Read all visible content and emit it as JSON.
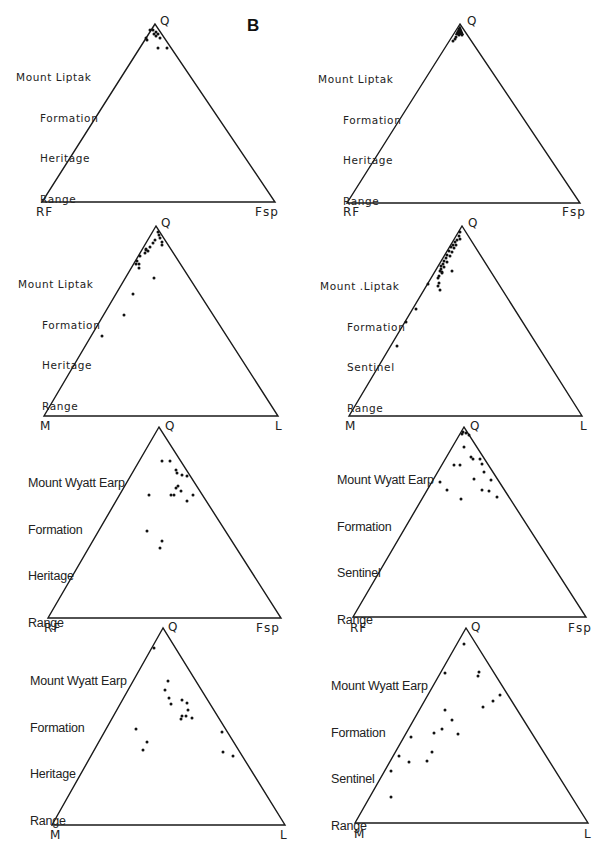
{
  "figure": {
    "panel_letter": "B",
    "top_edge_letter": "A"
  },
  "chart_data": [
    {
      "type": "scatter",
      "subtype": "ternary",
      "id": "p1",
      "caption": [
        "Mount Liptak",
        "Formation",
        "Heritage",
        "Range"
      ],
      "vertices": {
        "top": "Q",
        "left": "RF",
        "right": "Fsp"
      },
      "geom": {
        "apex": [
          155,
          24
        ],
        "left": [
          42,
          202
        ],
        "right": [
          275,
          202
        ]
      },
      "points_px": [
        [
          150,
          30
        ],
        [
          153,
          30
        ],
        [
          156,
          32
        ],
        [
          158,
          34
        ],
        [
          156,
          36
        ],
        [
          146,
          38
        ],
        [
          160,
          38
        ],
        [
          147,
          40
        ],
        [
          158,
          48
        ],
        [
          167,
          48
        ],
        [
          154,
          34
        ]
      ]
    },
    {
      "type": "scatter",
      "subtype": "ternary",
      "id": "p2",
      "caption": [
        "Mount Liptak",
        "Formation",
        "Heritage",
        "Range"
      ],
      "vertices": {
        "top": "Q",
        "left": "RF",
        "right": "Fsp"
      },
      "geom": {
        "apex": [
          460,
          24
        ],
        "left": [
          347,
          203
        ],
        "right": [
          580,
          203
        ]
      },
      "cluster_note": "dense filled cluster at Q apex",
      "points_px": [
        [
          459,
          29
        ],
        [
          460,
          31
        ],
        [
          458,
          32
        ],
        [
          461,
          33
        ],
        [
          457,
          34
        ],
        [
          459,
          35
        ],
        [
          462,
          35
        ],
        [
          456,
          37
        ],
        [
          455,
          39
        ],
        [
          453,
          41
        ]
      ]
    },
    {
      "type": "scatter",
      "subtype": "ternary",
      "id": "p3",
      "caption": [
        "Mount Liptak",
        "Formation",
        "Heritage",
        "Range"
      ],
      "vertices": {
        "top": "Q",
        "left": "M",
        "right": "L"
      },
      "geom": {
        "apex": [
          156,
          226
        ],
        "left": [
          44,
          416
        ],
        "right": [
          278,
          416
        ]
      },
      "points_px": [
        [
          158,
          232
        ],
        [
          159,
          235
        ],
        [
          160,
          238
        ],
        [
          155,
          240
        ],
        [
          162,
          242
        ],
        [
          153,
          243
        ],
        [
          162,
          245
        ],
        [
          150,
          247
        ],
        [
          146,
          249
        ],
        [
          148,
          251
        ],
        [
          145,
          253
        ],
        [
          146,
          250
        ],
        [
          140,
          256
        ],
        [
          137,
          261
        ],
        [
          136,
          264
        ],
        [
          139,
          264
        ],
        [
          139,
          268
        ],
        [
          154,
          278
        ],
        [
          133,
          294
        ],
        [
          124,
          315
        ],
        [
          102,
          336
        ]
      ]
    },
    {
      "type": "scatter",
      "subtype": "ternary",
      "id": "p4",
      "caption": [
        "Mount .Liptak",
        "Formation",
        "Sentinel",
        "Range"
      ],
      "vertices": {
        "top": "Q",
        "left": "M",
        "right": "L"
      },
      "geom": {
        "apex": [
          462,
          226
        ],
        "left": [
          349,
          416
        ],
        "right": [
          582,
          416
        ]
      },
      "points_px": [
        [
          460,
          232
        ],
        [
          459,
          236
        ],
        [
          457,
          240
        ],
        [
          460,
          239
        ],
        [
          455,
          242
        ],
        [
          453,
          245
        ],
        [
          456,
          245
        ],
        [
          451,
          247
        ],
        [
          454,
          248
        ],
        [
          449,
          251
        ],
        [
          452,
          252
        ],
        [
          447,
          255
        ],
        [
          450,
          256
        ],
        [
          446,
          258
        ],
        [
          444,
          261
        ],
        [
          447,
          262
        ],
        [
          443,
          264
        ],
        [
          441,
          266
        ],
        [
          444,
          267
        ],
        [
          441,
          269
        ],
        [
          440,
          271
        ],
        [
          442,
          273
        ],
        [
          439,
          276
        ],
        [
          442,
          272
        ],
        [
          438,
          278
        ],
        [
          452,
          271
        ],
        [
          439,
          283
        ],
        [
          438,
          286
        ],
        [
          440,
          290
        ],
        [
          428,
          284
        ],
        [
          416,
          309
        ],
        [
          406,
          322
        ],
        [
          397,
          346
        ]
      ]
    },
    {
      "type": "scatter",
      "subtype": "ternary",
      "id": "p5",
      "caption": [
        "Mount Wyatt Earp",
        "Formation",
        "Heritage",
        "Range"
      ],
      "vertices": {
        "top": "Q",
        "left": "RF",
        "right": "Fsp"
      },
      "geom": {
        "apex": [
          159,
          427
        ],
        "left": [
          48,
          618
        ],
        "right": [
          281,
          618
        ]
      },
      "points_px": [
        [
          162,
          461
        ],
        [
          170,
          461
        ],
        [
          176,
          470
        ],
        [
          177,
          473
        ],
        [
          182,
          475
        ],
        [
          187,
          476
        ],
        [
          178,
          486
        ],
        [
          176,
          488
        ],
        [
          181,
          491
        ],
        [
          171,
          495
        ],
        [
          174,
          495
        ],
        [
          193,
          495
        ],
        [
          149,
          495
        ],
        [
          187,
          501
        ],
        [
          147,
          531
        ],
        [
          162,
          541
        ],
        [
          160,
          548
        ]
      ]
    },
    {
      "type": "scatter",
      "subtype": "ternary",
      "id": "p6",
      "caption": [
        "Mount Wyatt Earp",
        "Formation",
        "Sentinel",
        "Range"
      ],
      "vertices": {
        "top": "Q",
        "left": "RF",
        "right": "Fsp"
      },
      "geom": {
        "apex": [
          464,
          427
        ],
        "left": [
          353,
          617
        ],
        "right": [
          586,
          617
        ]
      },
      "cluster_note": "small cluster of marks at Q apex",
      "points_px": [
        [
          463,
          432
        ],
        [
          462,
          434
        ],
        [
          466,
          433
        ],
        [
          469,
          435
        ],
        [
          464,
          447
        ],
        [
          471,
          457
        ],
        [
          473,
          459
        ],
        [
          480,
          459
        ],
        [
          454,
          465
        ],
        [
          460,
          465
        ],
        [
          482,
          464
        ],
        [
          484,
          472
        ],
        [
          440,
          482
        ],
        [
          474,
          479
        ],
        [
          491,
          480
        ],
        [
          447,
          490
        ],
        [
          482,
          490
        ],
        [
          489,
          491
        ],
        [
          461,
          499
        ],
        [
          497,
          497
        ]
      ]
    },
    {
      "type": "scatter",
      "subtype": "ternary",
      "id": "p7",
      "caption": [
        "Mount Wyatt Earp",
        "Formation",
        "Heritage",
        "Range"
      ],
      "vertices": {
        "top": "Q",
        "left": "M",
        "right": "L"
      },
      "geom": {
        "apex": [
          163,
          628
        ],
        "left": [
          52,
          825
        ],
        "right": [
          285,
          825
        ]
      },
      "points_px": [
        [
          154,
          648
        ],
        [
          168,
          681
        ],
        [
          165,
          690
        ],
        [
          169,
          698
        ],
        [
          171,
          704
        ],
        [
          182,
          700
        ],
        [
          187,
          703
        ],
        [
          188,
          710
        ],
        [
          182,
          716
        ],
        [
          181,
          719
        ],
        [
          186,
          716
        ],
        [
          192,
          718
        ],
        [
          136,
          729
        ],
        [
          147,
          742
        ],
        [
          143,
          750
        ],
        [
          222,
          732
        ],
        [
          223,
          752
        ],
        [
          233,
          756
        ]
      ]
    },
    {
      "type": "scatter",
      "subtype": "ternary",
      "id": "p8",
      "caption": [
        "Mount Wyatt Earp",
        "Formation",
        "Sentinel",
        "Range"
      ],
      "vertices": {
        "top": "Q",
        "left": "M",
        "right": "L"
      },
      "geom": {
        "apex": [
          466,
          628
        ],
        "left": [
          355,
          823
        ],
        "right": [
          588,
          823
        ]
      },
      "points_px": [
        [
          464,
          644
        ],
        [
          445,
          673
        ],
        [
          479,
          672
        ],
        [
          478,
          676
        ],
        [
          500,
          695
        ],
        [
          493,
          701
        ],
        [
          483,
          707
        ],
        [
          445,
          710
        ],
        [
          452,
          720
        ],
        [
          434,
          733
        ],
        [
          442,
          729
        ],
        [
          458,
          734
        ],
        [
          411,
          737
        ],
        [
          399,
          756
        ],
        [
          432,
          752
        ],
        [
          427,
          761
        ],
        [
          409,
          762
        ],
        [
          391,
          771
        ],
        [
          391,
          797
        ]
      ]
    }
  ]
}
